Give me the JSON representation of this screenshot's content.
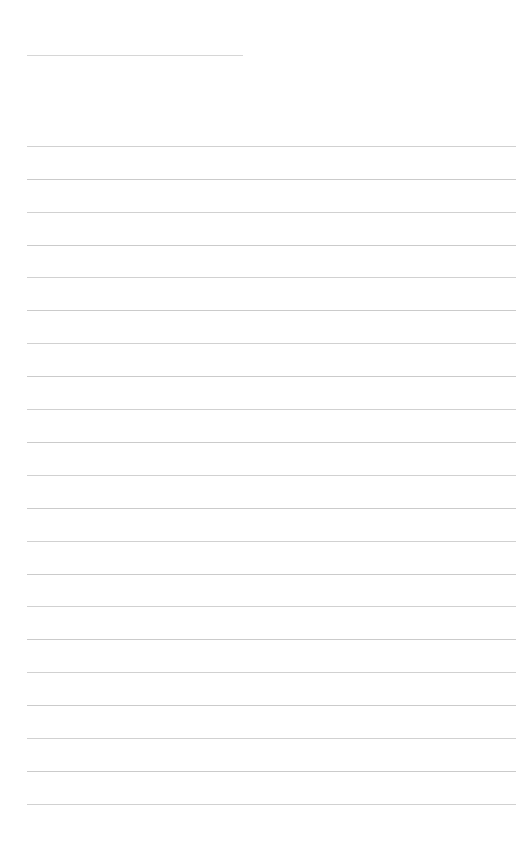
{
  "page": {
    "background_color": "#ffffff",
    "width": 521,
    "height": 853,
    "title_text": "",
    "body_text": ""
  },
  "ruling": {
    "line_color": "#cbcbcb",
    "title_line_color": "#d6d6d6",
    "line_thickness": 1,
    "left_margin": 27,
    "right_margin": 516,
    "line_spacing": 32.9,
    "title_rule": {
      "y": 55,
      "x_start": 27,
      "x_end": 243
    },
    "body_rules": [
      {
        "y": 146,
        "x_start": 27,
        "x_end": 516
      },
      {
        "y": 179,
        "x_start": 27,
        "x_end": 516
      },
      {
        "y": 212,
        "x_start": 27,
        "x_end": 516
      },
      {
        "y": 245,
        "x_start": 27,
        "x_end": 516
      },
      {
        "y": 277,
        "x_start": 27,
        "x_end": 516
      },
      {
        "y": 310,
        "x_start": 27,
        "x_end": 516
      },
      {
        "y": 343,
        "x_start": 27,
        "x_end": 516
      },
      {
        "y": 376,
        "x_start": 27,
        "x_end": 516
      },
      {
        "y": 409,
        "x_start": 27,
        "x_end": 516
      },
      {
        "y": 442,
        "x_start": 27,
        "x_end": 516
      },
      {
        "y": 475,
        "x_start": 27,
        "x_end": 516
      },
      {
        "y": 508,
        "x_start": 27,
        "x_end": 516
      },
      {
        "y": 541,
        "x_start": 27,
        "x_end": 516
      },
      {
        "y": 574,
        "x_start": 27,
        "x_end": 516
      },
      {
        "y": 606,
        "x_start": 27,
        "x_end": 516
      },
      {
        "y": 639,
        "x_start": 27,
        "x_end": 516
      },
      {
        "y": 672,
        "x_start": 27,
        "x_end": 516
      },
      {
        "y": 705,
        "x_start": 27,
        "x_end": 516
      },
      {
        "y": 738,
        "x_start": 27,
        "x_end": 516
      },
      {
        "y": 771,
        "x_start": 27,
        "x_end": 516
      },
      {
        "y": 804,
        "x_start": 27,
        "x_end": 516
      }
    ]
  }
}
